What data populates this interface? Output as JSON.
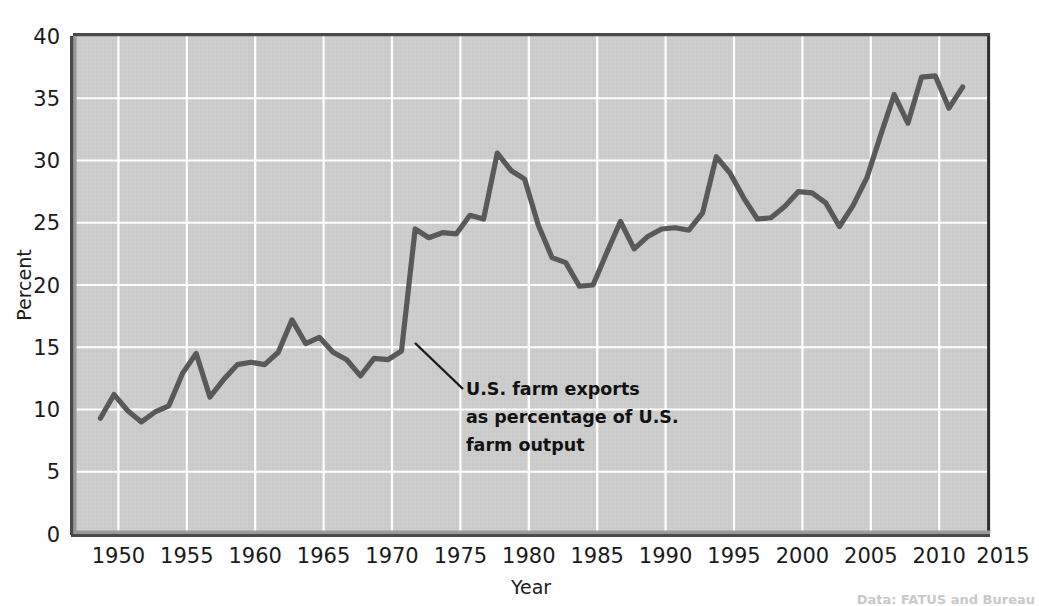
{
  "chart_data": {
    "type": "line",
    "title": "",
    "xlabel": "Year",
    "ylabel": "Percent",
    "xlim": [
      1948,
      2015
    ],
    "ylim": [
      0,
      40
    ],
    "xticks": [
      1950,
      1955,
      1960,
      1965,
      1970,
      1975,
      1980,
      1985,
      1990,
      1995,
      2000,
      2005,
      2010,
      2015
    ],
    "xticklabels": [
      "1950",
      "1955",
      "1960",
      "1965",
      "1970",
      "1975",
      "1980",
      "1985",
      "1990",
      "1995",
      "2000",
      "2005",
      "2010",
      "2015"
    ],
    "yticks": [
      0,
      5,
      10,
      15,
      20,
      25,
      30,
      35,
      40
    ],
    "yticklabels": [
      "0",
      "5",
      "10",
      "15",
      "20",
      "25",
      "30",
      "35",
      "40"
    ],
    "grid": true,
    "legend": false,
    "series": [
      {
        "name": "U.S. farm exports as percentage of U.S. farm output",
        "color": "#59595b",
        "x": [
          1950,
          1951,
          1952,
          1953,
          1954,
          1955,
          1956,
          1957,
          1958,
          1959,
          1960,
          1961,
          1962,
          1963,
          1964,
          1965,
          1966,
          1967,
          1968,
          1969,
          1970,
          1971,
          1972,
          1973,
          1974,
          1975,
          1976,
          1977,
          1978,
          1979,
          1980,
          1981,
          1982,
          1983,
          1984,
          1985,
          1986,
          1987,
          1988,
          1989,
          1990,
          1991,
          1992,
          1993,
          1994,
          1995,
          1996,
          1997,
          1998,
          1999,
          2000,
          2001,
          2002,
          2003,
          2004,
          2005,
          2006,
          2007,
          2008,
          2009,
          2010,
          2011,
          2012,
          2013
        ],
        "values": [
          9.3,
          11.2,
          9.9,
          9.0,
          9.8,
          10.3,
          12.9,
          14.5,
          11.0,
          12.4,
          13.6,
          13.8,
          13.6,
          14.6,
          17.2,
          15.3,
          15.8,
          14.6,
          14.0,
          12.7,
          14.1,
          14.0,
          14.7,
          24.5,
          23.8,
          24.2,
          24.1,
          25.6,
          25.3,
          30.6,
          29.2,
          28.5,
          24.8,
          22.2,
          21.8,
          19.9,
          20.0,
          22.6,
          25.1,
          22.9,
          23.9,
          24.5,
          24.6,
          24.4,
          25.8,
          30.3,
          29.0,
          27.0,
          25.3,
          25.4,
          26.3,
          27.5,
          27.4,
          26.6,
          24.7,
          26.4,
          28.6,
          32.0,
          35.3,
          33.0,
          36.7,
          36.8,
          34.2,
          35.9
        ]
      }
    ],
    "annotations": [
      {
        "name": "series-callout",
        "lines": [
          "U.S. farm exports",
          "as percentage of U.S.",
          "farm output"
        ],
        "point": [
          1972,
          14.7
        ]
      }
    ],
    "style": {
      "plot_background": "#cccccc",
      "gridline_color": "#ffffff",
      "line_color": "#59595b",
      "axis_color": "#4d4d4f",
      "text_color": "#1a1a1a",
      "page_background": "#ffffff"
    }
  },
  "source_note": {
    "text": "Data: FATUS and Bureau"
  }
}
